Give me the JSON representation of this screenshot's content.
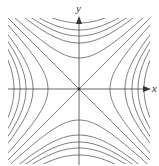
{
  "diagram": {
    "type": "level-curves",
    "axes": {
      "x_label": "x",
      "y_label": "y"
    },
    "origin_px": [
      79,
      89
    ],
    "clip_box_px": [
      8,
      18,
      150,
      162
    ],
    "horizontal_vertices_px": [
      31,
      46,
      53,
      59,
      65
    ],
    "vertical_vertices_px": [
      31,
      46,
      53,
      59,
      66
    ],
    "colors": {
      "curve": "#6e6e6e",
      "axis": "#555555",
      "background": "#ffffff"
    }
  }
}
